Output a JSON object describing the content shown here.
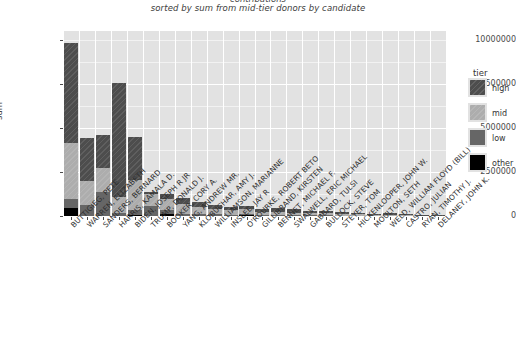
{
  "chart_data": {
    "type": "bar",
    "stacked": true,
    "title": "contributions",
    "subtitle": "sorted by sum from mid-tier donors by candidate",
    "xlabel": "",
    "ylabel": "sum",
    "ylim": [
      0,
      10500000
    ],
    "yticks": [
      0,
      2500000,
      5000000,
      7500000,
      10000000
    ],
    "ytick_labels": [
      "0",
      "2500000",
      "5000000",
      "7500000",
      "10000000"
    ],
    "grid": true,
    "legend": {
      "title": "tier",
      "position": "right",
      "entries": [
        {
          "label": "high",
          "color": "#4d4d4d"
        },
        {
          "label": "mid",
          "color": "#adadad"
        },
        {
          "label": "low",
          "color": "#666666"
        },
        {
          "label": "other",
          "color": "#000000"
        }
      ]
    },
    "series": [
      {
        "name": "other",
        "values": [
          450000,
          0,
          0,
          0,
          70000,
          0,
          120000,
          0,
          0,
          0,
          0,
          60000,
          0,
          0,
          0,
          0,
          0,
          0,
          0,
          0,
          0,
          0,
          0,
          0
        ]
      },
      {
        "name": "low",
        "values": [
          490000,
          620000,
          1350000,
          180000,
          280000,
          570000,
          230000,
          110000,
          90000,
          110000,
          60000,
          70000,
          50000,
          45000,
          40000,
          35000,
          30000,
          25000,
          20000,
          15000,
          12000,
          10000,
          8000,
          6000
        ]
      },
      {
        "name": "mid",
        "values": [
          3200000,
          1380000,
          1370000,
          920000,
          1700000,
          690000,
          600000,
          560000,
          420000,
          310000,
          280000,
          250000,
          190000,
          160000,
          150000,
          130000,
          120000,
          100000,
          80000,
          60000,
          45000,
          35000,
          25000,
          20000
        ]
      },
      {
        "name": "high",
        "values": [
          5700000,
          2400000,
          1860000,
          6440000,
          2430000,
          120000,
          320000,
          330000,
          260000,
          230000,
          200000,
          170000,
          150000,
          250000,
          200000,
          120000,
          160000,
          130000,
          100000,
          60000,
          130000,
          60000,
          40000,
          30000
        ]
      }
    ],
    "categories": [
      "BUTTIGIEG, PETE",
      "WARREN, ELIZABETH",
      "SANDERS, BERNARD",
      "HARRIS, KAMALA D.",
      "BIDEN, JOSEPH R JR",
      "TRUMP, DONALD J.",
      "BOOKER, CORY A.",
      "YANG, ANDREW MR.",
      "KLOBUCHAR, AMY J.",
      "WILLIAMSON, MARIANNE",
      "INSLEE, JAY R",
      "O'ROURKE, ROBERT BETO",
      "GILLIBRAND, KIRSTEN",
      "BENNET, MICHAEL F.",
      "SWALWELL, ERIC MICHAEL",
      "GABBARD, TULSI",
      "BULLOCK, STEVE",
      "STEYER, TOM",
      "HICKENLOOPER, JOHN W.",
      "MOULTON, SETH",
      "WELD, WILLIAM FLOYD (BILL)",
      "CASTRO, JULIAN",
      "RYAN, TIMOTHY J.",
      "DELANEY, JOHN K."
    ]
  }
}
